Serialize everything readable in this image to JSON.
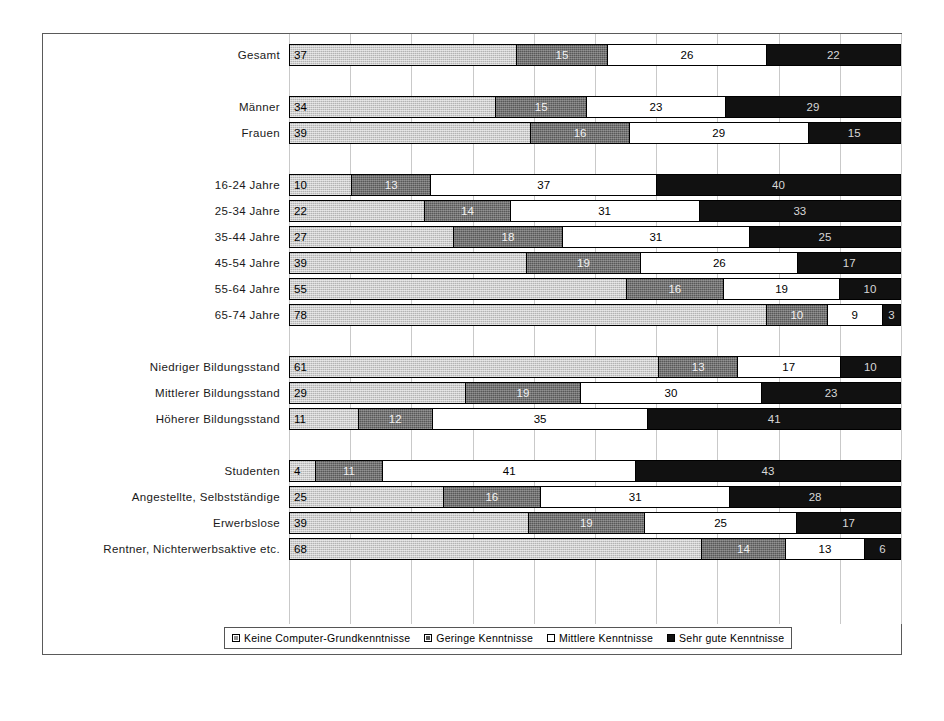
{
  "chart_data": {
    "type": "bar",
    "orientation": "horizontal",
    "stacked": true,
    "normalized_percent": true,
    "title": "",
    "subtitle": "",
    "xlabel": "",
    "ylabel": "",
    "xlim": [
      0,
      100
    ],
    "grid": true,
    "gridline_step": 10,
    "legend_position": "bottom",
    "categories": [
      "Gesamt",
      "",
      "Männer",
      "Frauen",
      "",
      "16-24 Jahre",
      "25-34 Jahre",
      "35-44 Jahre",
      "45-54 Jahre",
      "55-64 Jahre",
      "65-74 Jahre",
      "",
      "Niedriger Bildungsstand",
      "Mittlerer Bildungsstand",
      "Höherer Bildungsstand",
      "",
      "Studenten",
      "Angestellte, Selbstständige",
      "Erwerbslose",
      "Rentner, Nichterwerbsaktive etc."
    ],
    "series": [
      {
        "name": "Keine Computer-Grundkenntnisse",
        "color": "#b3b3b3",
        "values": [
          37,
          null,
          34,
          39,
          null,
          10,
          22,
          27,
          39,
          55,
          78,
          null,
          61,
          29,
          11,
          null,
          4,
          25,
          39,
          68
        ]
      },
      {
        "name": "Geringe Kenntnisse",
        "color": "#585858",
        "values": [
          15,
          null,
          15,
          16,
          null,
          13,
          14,
          18,
          19,
          16,
          10,
          null,
          13,
          19,
          12,
          null,
          11,
          16,
          19,
          14
        ]
      },
      {
        "name": "Mittlere Kenntnisse",
        "color": "#ffffff",
        "values": [
          26,
          null,
          23,
          29,
          null,
          37,
          31,
          31,
          26,
          19,
          9,
          null,
          17,
          30,
          35,
          null,
          41,
          31,
          25,
          13
        ]
      },
      {
        "name": "Sehr gute Kenntnisse",
        "color": "#111111",
        "values": [
          22,
          null,
          29,
          15,
          null,
          40,
          33,
          25,
          17,
          10,
          3,
          null,
          10,
          23,
          41,
          null,
          43,
          28,
          17,
          6
        ]
      }
    ]
  },
  "legend": {
    "items": [
      {
        "label": "Keine Computer-Grundkenntnisse",
        "key": "k0"
      },
      {
        "label": "Geringe Kenntnisse",
        "key": "k1"
      },
      {
        "label": "Mittlere Kenntnisse",
        "key": "k2"
      },
      {
        "label": "Sehr gute Kenntnisse",
        "key": "k3"
      }
    ]
  }
}
